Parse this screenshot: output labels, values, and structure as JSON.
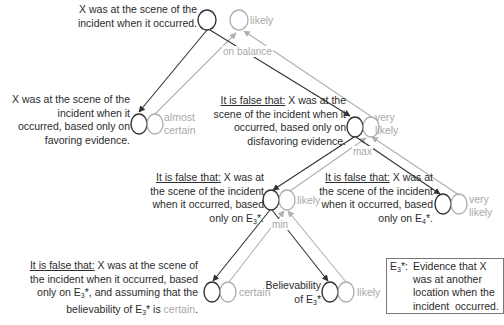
{
  "colors": {
    "belief_line": "#333333",
    "credibility_line": "#b0b0b0",
    "text": "#2b2b2b",
    "muted_label": "#a9a9a9",
    "note_border": "#777777"
  },
  "nodes": {
    "root": {
      "lines": [
        "X was at the scene of the",
        "incident when it occurred."
      ],
      "value": "likely"
    },
    "favoring": {
      "lines": [
        "X was at the scene of the",
        "incident when it",
        "occurred, based only on",
        "favoring evidence."
      ],
      "value_line1": "almost",
      "value_line2": "certain"
    },
    "disfavoring": {
      "prefix": "It is false that:",
      "lines_first_rest": " X was at the",
      "lines": [
        "scene of the incident when it",
        "occurred, based only on",
        "disfavoring evidence."
      ],
      "value_line1": "very",
      "value_line2": "likely"
    },
    "e3": {
      "prefix": "It is false that:",
      "lines_first_rest": " X was at",
      "lines": [
        "the scene of the incident",
        "when it occurred, based"
      ],
      "last_prefix": "only on E",
      "last_sub": "3",
      "last_suffix": "*.",
      "value": "likely"
    },
    "e4": {
      "prefix": "It is false that:",
      "lines_first_rest": " X was at",
      "lines": [
        "the scene of the incident",
        "when it occurred, based"
      ],
      "last_prefix": "only on E",
      "last_sub": "4",
      "last_suffix": "*.",
      "value_line1": "very",
      "value_line2": "likely"
    },
    "e3_certain": {
      "prefix": "It is false that:",
      "lines_first_rest": " X was at the scene of",
      "line2": "the incident when it occurred, based",
      "line3_prefix": "only on E",
      "line3_sub": "3",
      "line3_suffix": "*, and assuming that the",
      "line4_prefix": "believability of E",
      "line4_sub": "3",
      "line4_mid": "* is ",
      "line4_colored": "certain",
      "line4_end": ".",
      "value": "certain"
    },
    "believability": {
      "line1": "Believability",
      "line2_prefix": "of E",
      "line2_sub": "3",
      "line2_suffix": "*",
      "value": "likely"
    }
  },
  "operators": {
    "root": "on balance",
    "disfavoring": "max",
    "e3": "min"
  },
  "note": {
    "head_prefix": "E",
    "head_sub": "3",
    "head_suffix": "*:",
    "lines": [
      "Evidence that X",
      "was at another",
      "location when the",
      "incident  occurred."
    ]
  }
}
